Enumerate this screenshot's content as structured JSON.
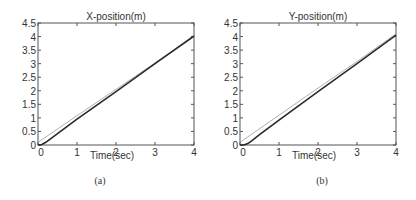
{
  "chart_data": [
    {
      "type": "line",
      "panel": "a",
      "caption": "(a)",
      "title": "X-position(m)",
      "xlabel": "Time(sec)",
      "ylabel": "",
      "xlim": [
        0,
        4
      ],
      "ylim": [
        0,
        4.5
      ],
      "xticks": [
        "0",
        "1",
        "2",
        "3",
        "4"
      ],
      "yticks": [
        "0",
        "0.5",
        "1",
        "1.5",
        "2",
        "2.5",
        "3",
        "3.5",
        "4",
        "4.5"
      ],
      "grid": false,
      "series": [
        {
          "name": "reference",
          "style": "thin-gray",
          "x": [
            0,
            1,
            2,
            3,
            4
          ],
          "y": [
            0.1,
            1.08,
            2.05,
            3.03,
            4.0
          ]
        },
        {
          "name": "actual",
          "style": "solid-dark",
          "x": [
            0,
            0.1,
            0.2,
            0.5,
            1,
            2,
            3,
            4
          ],
          "y": [
            0,
            0.02,
            0.1,
            0.42,
            0.95,
            1.97,
            3.0,
            4.02
          ]
        }
      ]
    },
    {
      "type": "line",
      "panel": "b",
      "caption": "(b)",
      "title": "Y-position(m)",
      "xlabel": "Time(sec)",
      "ylabel": "",
      "xlim": [
        0,
        4
      ],
      "ylim": [
        0,
        4.5
      ],
      "xticks": [
        "0",
        "1",
        "2",
        "3",
        "4"
      ],
      "yticks": [
        "0",
        "0.5",
        "1",
        "1.5",
        "2",
        "2.5",
        "3",
        "3.5",
        "4",
        "4.5"
      ],
      "grid": false,
      "series": [
        {
          "name": "reference",
          "style": "thin-gray",
          "x": [
            0,
            1,
            2,
            3,
            4
          ],
          "y": [
            0.1,
            1.1,
            2.1,
            3.08,
            4.1
          ]
        },
        {
          "name": "actual",
          "style": "solid-dark",
          "x": [
            0,
            0.1,
            0.2,
            0.3,
            0.5,
            1,
            2,
            3,
            4
          ],
          "y": [
            0,
            0.0,
            0.05,
            0.15,
            0.38,
            0.92,
            1.97,
            3.0,
            4.05
          ]
        }
      ]
    }
  ]
}
